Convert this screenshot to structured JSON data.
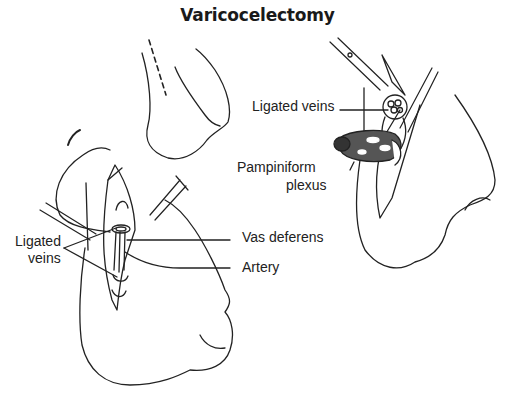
{
  "diagram": {
    "title": "Varicocelectomy",
    "figures": [
      {
        "id": "skin-marking",
        "description": "Scrotum with dashed incision line"
      },
      {
        "id": "left-incision",
        "labels": {
          "ligated_veins_line1": "Ligated",
          "ligated_veins_line2": "veins",
          "vas_deferens": "Vas deferens",
          "artery": "Artery"
        }
      },
      {
        "id": "right-incision",
        "labels": {
          "ligated_veins": "Ligated veins",
          "pampiniform_line1": "Pampiniform",
          "pampiniform_line2": "plexus"
        }
      }
    ],
    "colors": {
      "line": "#222222",
      "plexus_fill": "#555555",
      "background": "#ffffff"
    }
  }
}
